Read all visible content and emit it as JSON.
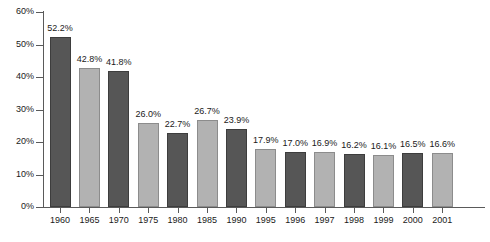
{
  "chart_data": {
    "type": "bar",
    "title": "",
    "subtitle": "",
    "xlabel": "",
    "ylabel": "",
    "ylim": [
      0,
      60
    ],
    "grid": false,
    "legend": "none",
    "categories": [
      "1960",
      "1965",
      "1970",
      "1975",
      "1980",
      "1985",
      "1990",
      "1995",
      "1996",
      "1997",
      "1998",
      "1999",
      "2000",
      "2001"
    ],
    "values": [
      52.2,
      42.8,
      41.8,
      26.0,
      22.7,
      26.7,
      23.9,
      17.9,
      17.0,
      16.9,
      16.2,
      16.1,
      16.5,
      16.6
    ],
    "data_labels": [
      "52.2%",
      "42.8%",
      "41.8%",
      "26.0%",
      "22.7%",
      "26.7%",
      "23.9%",
      "17.9%",
      "17.0%",
      "16.9%",
      "16.2%",
      "16.1%",
      "16.5%",
      "16.6%"
    ],
    "bar_colors": [
      "dark",
      "light",
      "dark",
      "light",
      "dark",
      "light",
      "dark",
      "light",
      "dark",
      "light",
      "dark",
      "light",
      "dark",
      "light"
    ],
    "y_ticks": [
      0,
      10,
      20,
      30,
      40,
      50,
      60
    ],
    "y_tick_labels": [
      "0%",
      "10%",
      "20%",
      "30%",
      "40%",
      "50%",
      "60%"
    ],
    "colors": {
      "dark_bar": "#565656",
      "light_bar": "#b2b2b2",
      "axis": "#5a5a5a",
      "text": "#1a1a1a",
      "background": "#ffffff"
    }
  }
}
